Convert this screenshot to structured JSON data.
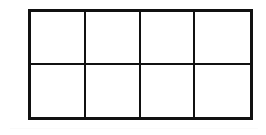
{
  "figure": {
    "name": "rectangle-grid",
    "rows": 2,
    "columns": 4,
    "total_cells": 8,
    "geometry": {
      "left": 28,
      "top": 9,
      "width": 225,
      "height": 111,
      "cell_width": 56,
      "cell_height": 55
    },
    "style": {
      "line_color": "#111111",
      "outer_line_width": 3,
      "inner_line_width": 2,
      "cell_fill": "#ffffff",
      "page_background": "#ffffff"
    },
    "cells": [
      {
        "row": 1,
        "column": 1,
        "label": ""
      },
      {
        "row": 1,
        "column": 2,
        "label": ""
      },
      {
        "row": 1,
        "column": 3,
        "label": ""
      },
      {
        "row": 1,
        "column": 4,
        "label": ""
      },
      {
        "row": 2,
        "column": 1,
        "label": ""
      },
      {
        "row": 2,
        "column": 2,
        "label": ""
      },
      {
        "row": 2,
        "column": 3,
        "label": ""
      },
      {
        "row": 2,
        "column": 4,
        "label": ""
      }
    ]
  },
  "artifacts": {
    "bottom_scan_line": {
      "visible": true,
      "top": 128,
      "color": "#fafafa"
    }
  }
}
